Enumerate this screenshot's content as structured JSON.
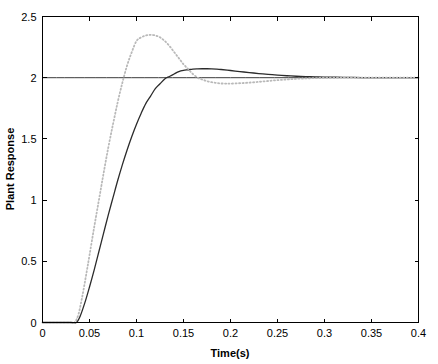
{
  "chart_data": {
    "type": "line",
    "title": "",
    "xlabel": "Time(s)",
    "ylabel": "Plant Response",
    "xlim": [
      0,
      0.4
    ],
    "ylim": [
      0,
      2.5
    ],
    "xticks": [
      0,
      0.05,
      0.1,
      0.15,
      0.2,
      0.25,
      0.3,
      0.35,
      0.4
    ],
    "xtick_labels": [
      "0",
      "0.05",
      "0.1",
      "0.15",
      "0.2",
      "0.25",
      "0.3",
      "0.35",
      "0.4"
    ],
    "yticks": [
      0,
      0.5,
      1,
      1.5,
      2,
      2.5
    ],
    "ytick_labels": [
      "0",
      "0.5",
      "1",
      "1.5",
      "2",
      "2.5"
    ],
    "grid": false,
    "legend": "none",
    "box": true,
    "annotations": [
      {
        "type": "hline",
        "y": 2.0,
        "label": "reference setpoint",
        "color": "#3a3a3a"
      }
    ],
    "series": [
      {
        "name": "reference",
        "style": "solid",
        "color": "#3a3a3a",
        "x": [
          0,
          0.4
        ],
        "values": [
          2.0,
          2.0
        ]
      },
      {
        "name": "slower response",
        "style": "solid",
        "color": "#2b2b2b",
        "x": [
          0.0,
          0.01,
          0.02,
          0.03,
          0.036,
          0.04,
          0.045,
          0.05,
          0.055,
          0.06,
          0.065,
          0.07,
          0.075,
          0.08,
          0.085,
          0.09,
          0.095,
          0.1,
          0.105,
          0.11,
          0.115,
          0.12,
          0.125,
          0.13,
          0.135,
          0.14,
          0.145,
          0.15,
          0.155,
          0.16,
          0.165,
          0.17,
          0.175,
          0.18,
          0.185,
          0.19,
          0.2,
          0.21,
          0.22,
          0.23,
          0.24,
          0.25,
          0.26,
          0.27,
          0.28,
          0.29,
          0.3,
          0.32,
          0.34,
          0.36,
          0.38,
          0.4
        ],
        "values": [
          0.0,
          0.0,
          0.0,
          0.0,
          0.0,
          0.05,
          0.16,
          0.29,
          0.43,
          0.58,
          0.73,
          0.88,
          1.02,
          1.16,
          1.29,
          1.41,
          1.52,
          1.62,
          1.71,
          1.79,
          1.85,
          1.91,
          1.95,
          1.99,
          2.01,
          2.03,
          2.05,
          2.06,
          2.065,
          2.07,
          2.072,
          2.073,
          2.073,
          2.072,
          2.07,
          2.067,
          2.059,
          2.05,
          2.042,
          2.034,
          2.027,
          2.021,
          2.016,
          2.012,
          2.009,
          2.007,
          2.005,
          2.003,
          2.001,
          2.001,
          2.0,
          2.0
        ]
      },
      {
        "name": "faster response",
        "style": "dotted",
        "color": "#b9b9b9",
        "x": [
          0.0,
          0.01,
          0.02,
          0.03,
          0.034,
          0.038,
          0.042,
          0.046,
          0.05,
          0.055,
          0.06,
          0.065,
          0.07,
          0.075,
          0.08,
          0.085,
          0.09,
          0.095,
          0.1,
          0.105,
          0.11,
          0.115,
          0.12,
          0.125,
          0.13,
          0.135,
          0.14,
          0.145,
          0.15,
          0.155,
          0.16,
          0.165,
          0.17,
          0.175,
          0.18,
          0.185,
          0.19,
          0.195,
          0.2,
          0.21,
          0.22,
          0.23,
          0.24,
          0.25,
          0.26,
          0.27,
          0.28,
          0.29,
          0.3,
          0.32,
          0.34,
          0.36,
          0.38,
          0.4
        ],
        "values": [
          0.0,
          0.0,
          0.0,
          0.0,
          0.0,
          0.06,
          0.2,
          0.37,
          0.55,
          0.78,
          1.0,
          1.22,
          1.43,
          1.62,
          1.8,
          1.96,
          2.1,
          2.21,
          2.3,
          2.33,
          2.345,
          2.35,
          2.345,
          2.33,
          2.3,
          2.26,
          2.21,
          2.16,
          2.11,
          2.07,
          2.03,
          2.0,
          1.985,
          1.972,
          1.963,
          1.957,
          1.953,
          1.952,
          1.952,
          1.955,
          1.96,
          1.966,
          1.973,
          1.98,
          1.986,
          1.991,
          1.994,
          1.997,
          1.998,
          2.0,
          2.0,
          2.0,
          2.0,
          2.0
        ]
      }
    ]
  },
  "axes": {
    "ylabel": "Plant Response",
    "xlabel": "Time(s)"
  }
}
